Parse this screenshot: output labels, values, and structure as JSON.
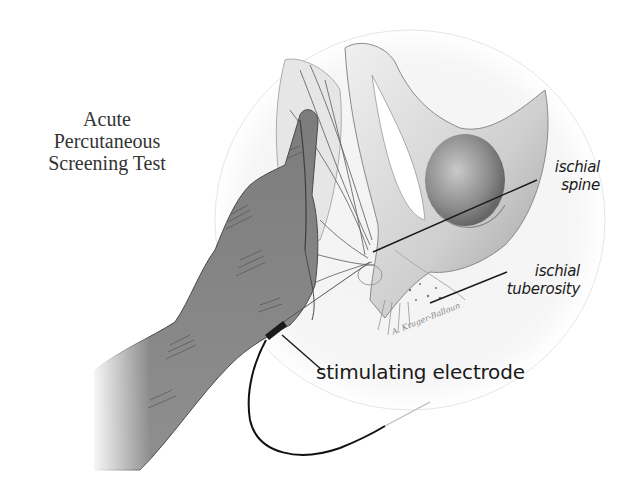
{
  "figure": {
    "title_lines": [
      "Acute",
      "Percutaneous",
      "Screening Test"
    ],
    "labels": {
      "ischial_spine": [
        "ischial",
        "spine"
      ],
      "ischial_tuberosity": [
        "ischial",
        "tuberosity"
      ],
      "stimulating_electrode": "stimulating electrode"
    },
    "signature": "A. Kruger-Balloun",
    "colors": {
      "background": "#ffffff",
      "glove": "#8c8c8c",
      "glove_shadow": "#5e5e5e",
      "bone": "#dcdcdc",
      "bone_shadow": "#9a9a9a",
      "ink": "#1a1a1a",
      "circle_fill": "#f4f4f4"
    }
  }
}
